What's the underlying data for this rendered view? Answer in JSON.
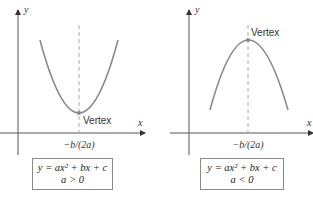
{
  "panels": [
    {
      "axis_x": "x",
      "axis_y": "y",
      "vertex_label": "Vertex",
      "tick_label": "−b/(2a)",
      "equation": "y = ax² + bx + c",
      "condition": "a > 0",
      "opens": "up"
    },
    {
      "axis_x": "x",
      "axis_y": "y",
      "vertex_label": "Vertex",
      "tick_label": "−b/(2a)",
      "equation": "y = ax² + bx + c",
      "condition": "a < 0",
      "opens": "down"
    }
  ],
  "colors": {
    "curve": "#8a8a8a",
    "axis": "#555555",
    "dashed": "#aaaaaa"
  }
}
